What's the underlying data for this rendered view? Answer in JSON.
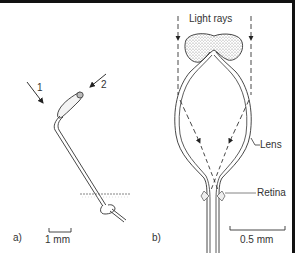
{
  "figure": {
    "panels": [
      {
        "id": "a",
        "label": "a)",
        "arrows": [
          {
            "label": "1"
          },
          {
            "label": "2"
          }
        ],
        "scale_bar": "1 mm"
      },
      {
        "id": "b",
        "label": "b)",
        "title": "Light rays",
        "annotations": {
          "lens": "Lens",
          "retina": "Retina"
        },
        "scale_bar": "0.5 mm"
      }
    ],
    "colors": {
      "line": "#333333",
      "border": "#111111",
      "stipple": "#888888"
    }
  }
}
